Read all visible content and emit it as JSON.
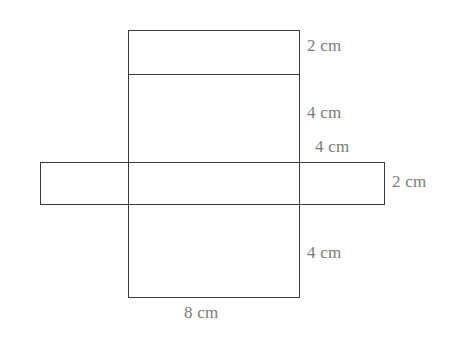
{
  "figure": {
    "stroke_color": "#3a3a3a",
    "label_color": "#7c7c7c",
    "background_color": "#ffffff",
    "units": "cm"
  },
  "labels": {
    "top_flap": "2 cm",
    "upper_face": "4 cm",
    "middle_face": "4 cm",
    "strip_height": "2 cm",
    "lower_face": "4 cm",
    "base_width": "8 cm"
  },
  "chart_data": {
    "type": "diagram",
    "shapes": [
      {
        "name": "vertical-column",
        "kind": "rectangle",
        "x": 128,
        "y": 30,
        "width": 172,
        "height": 268
      },
      {
        "name": "horizontal-strip",
        "kind": "rectangle",
        "x": 40,
        "y": 162,
        "width": 345,
        "height": 43
      },
      {
        "name": "top-flap-divider",
        "kind": "line",
        "x1": 128,
        "y1": 74,
        "x2": 300,
        "y2": 74
      }
    ],
    "annotations": [
      {
        "text": "2 cm",
        "x": 307,
        "y": 45,
        "measures": "top-flap-height"
      },
      {
        "text": "4 cm",
        "x": 307,
        "y": 112,
        "measures": "upper-face-height"
      },
      {
        "text": "4 cm",
        "x": 315,
        "y": 146,
        "measures": "middle-face-height"
      },
      {
        "text": "2 cm",
        "x": 392,
        "y": 181,
        "measures": "strip-height"
      },
      {
        "text": "4 cm",
        "x": 307,
        "y": 252,
        "measures": "lower-face-height"
      },
      {
        "text": "8 cm",
        "x": 184,
        "y": 312,
        "measures": "base-width"
      }
    ]
  }
}
